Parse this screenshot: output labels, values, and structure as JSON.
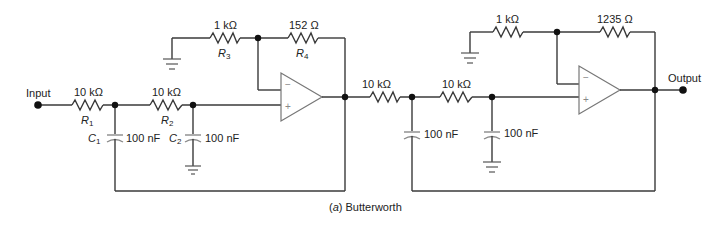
{
  "caption": {
    "letter": "a",
    "text": "Butterworth"
  },
  "ports": {
    "input": "Input",
    "output": "Output"
  },
  "stage1": {
    "R1": {
      "name": "R",
      "sub": "1",
      "value": "10 kΩ"
    },
    "R2": {
      "name": "R",
      "sub": "2",
      "value": "10 kΩ"
    },
    "R3": {
      "name": "R",
      "sub": "3",
      "value": "1 kΩ"
    },
    "R4": {
      "name": "R",
      "sub": "4",
      "value": "152 Ω"
    },
    "C1": {
      "name": "C",
      "sub": "1",
      "value": "100 nF"
    },
    "C2": {
      "name": "C",
      "sub": "2",
      "value": "100 nF"
    },
    "opamp": {
      "minus": "−",
      "plus": "+"
    }
  },
  "stage2": {
    "Ra": {
      "value": "10 kΩ"
    },
    "Rb": {
      "value": "10 kΩ"
    },
    "Rc": {
      "value": "1 kΩ"
    },
    "Rd": {
      "value": "1235 Ω"
    },
    "Ca": {
      "value": "100 nF"
    },
    "Cb": {
      "value": "100 nF"
    },
    "opamp": {
      "minus": "−",
      "plus": "+"
    }
  }
}
